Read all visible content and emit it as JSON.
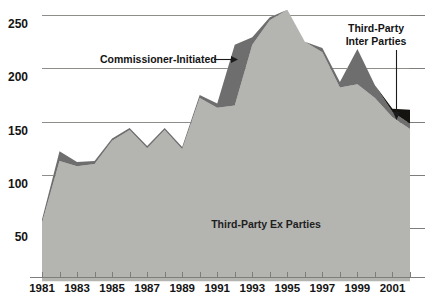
{
  "chart_data": {
    "type": "area",
    "title": "",
    "subtitle": "",
    "xlabel": "",
    "ylabel": "",
    "stacked": true,
    "grid": true,
    "legend_position": "inline-annotations",
    "ylim": [
      0,
      265
    ],
    "yticks": [
      50,
      100,
      150,
      200,
      250
    ],
    "ytick_labels": [
      "50",
      "100",
      "150",
      "200",
      "250"
    ],
    "xlim": [
      1981,
      2002
    ],
    "x": [
      1981,
      1982,
      1983,
      1984,
      1985,
      1986,
      1987,
      1988,
      1989,
      1990,
      1991,
      1992,
      1993,
      1994,
      1995,
      1996,
      1997,
      1998,
      1999,
      2000,
      2001,
      2002
    ],
    "xticks": [
      1981,
      1982,
      1983,
      1984,
      1985,
      1986,
      1987,
      1988,
      1989,
      1990,
      1991,
      1992,
      1993,
      1994,
      1995,
      1996,
      1997,
      1998,
      1999,
      2000,
      2001,
      2002
    ],
    "xtick_labels": [
      "1981",
      "",
      "1983",
      "",
      "1985",
      "",
      "1987",
      "",
      "1989",
      "",
      "1991",
      "",
      "1993",
      "",
      "1995",
      "",
      "1997",
      "",
      "1999",
      "",
      "2001",
      ""
    ],
    "xtick_labels_shown": [
      "1981",
      "1983",
      "1985",
      "1987",
      "1989",
      "1991",
      "1993",
      "1995",
      "1997",
      "1999",
      "2001"
    ],
    "series": [
      {
        "name": "Third-Party Ex Parties",
        "color": "#b4b4b0",
        "values": [
          55,
          113,
          108,
          110,
          132,
          142,
          125,
          142,
          124,
          172,
          163,
          165,
          222,
          245,
          255,
          225,
          215,
          182,
          185,
          172,
          154,
          143
        ]
      },
      {
        "name": "Commissioner-Initiated",
        "color": "#6e6e6e",
        "values": [
          3,
          9,
          4,
          3,
          2,
          2,
          2,
          2,
          2,
          3,
          4,
          57,
          7,
          3,
          0,
          0,
          4,
          5,
          33,
          12,
          5,
          5
        ]
      },
      {
        "name": "Third-Party Inter Parties",
        "color": "#15130f",
        "values": [
          0,
          0,
          0,
          0,
          0,
          0,
          0,
          0,
          0,
          0,
          0,
          0,
          0,
          0,
          0,
          0,
          0,
          0,
          0,
          0,
          3,
          13
        ]
      }
    ],
    "annotations": [
      {
        "name": "commissioner-initiated",
        "text": "Commissioner-Initiated",
        "lines": [
          "Commissioner-Initiated"
        ],
        "arrow": "right"
      },
      {
        "name": "third-party-inter-parties",
        "text": "Third-Party Inter Parties",
        "lines": [
          "Third-Party",
          "Inter Parties"
        ],
        "arrow": "down"
      },
      {
        "name": "third-party-ex-parties",
        "text": "Third-Party Ex Parties",
        "lines": [
          "Third-Party Ex Parties"
        ],
        "arrow": "none"
      }
    ],
    "colors": {
      "ex_parties": "#b4b4b0",
      "commissioner_initiated": "#6e6e6e",
      "inter_parties": "#15130f",
      "gridline": "#8d8d8a",
      "axis": "#7d7d7a",
      "text": "#141414",
      "background": "#ffffff"
    }
  }
}
